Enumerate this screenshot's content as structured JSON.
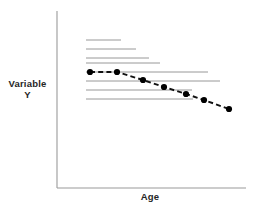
{
  "chart_data": {
    "type": "line",
    "title": "",
    "subtitle": "",
    "xlabel": "Age",
    "ylabel": "Variable\nY",
    "ylabel_line1": "Variable",
    "ylabel_line2": "Y",
    "grid": false,
    "legend": "none",
    "axis_ticks": "none",
    "xlim": [
      0,
      100
    ],
    "ylim": [
      0,
      100
    ],
    "series": [
      {
        "name": "Mean trajectory",
        "style": "dashed",
        "color": "#000000",
        "marker": "filled-circle",
        "marker_size": 4,
        "x": [
          15,
          31,
          47,
          60,
          73,
          84,
          99
        ],
        "y": [
          66,
          66,
          58,
          52,
          45,
          39,
          30
        ],
        "points": [
          {
            "x": 15,
            "y": 66
          },
          {
            "x": 31,
            "y": 66
          },
          {
            "x": 47,
            "y": 58
          },
          {
            "x": 60,
            "y": 52
          },
          {
            "x": 73,
            "y": 45
          },
          {
            "x": 84,
            "y": 39
          },
          {
            "x": 99,
            "y": 30
          }
        ]
      }
    ],
    "cohort_lines": [
      {
        "index": 1,
        "y": 83,
        "x_start": 15,
        "x_end": 34
      },
      {
        "index": 2,
        "y": 78,
        "x_start": 15,
        "x_end": 42
      },
      {
        "index": 3,
        "y": 73,
        "x_start": 15,
        "x_end": 45
      },
      {
        "index": 4,
        "y": 71,
        "x_start": 15,
        "x_end": 52
      },
      {
        "index": 5,
        "y": 66,
        "x_start": 15,
        "x_end": 81
      },
      {
        "index": 6,
        "y": 61,
        "x_start": 15,
        "x_end": 88
      },
      {
        "index": 7,
        "y": 56,
        "x_start": 15,
        "x_end": 73
      },
      {
        "index": 8,
        "y": 50,
        "x_start": 15,
        "x_end": 73
      }
    ]
  },
  "colors": {
    "axis": "#9a9a9a",
    "cohort_line": "#8c8c8c",
    "trend_line": "#111111",
    "marker_fill": "#000000",
    "label_text": "#262626",
    "background": "#ffffff"
  },
  "geometry": {
    "axis_x": 57,
    "axis_top": 11,
    "axis_bottom": 188,
    "axis_right": 246,
    "cohort_x_start": 86,
    "cohort_rows_y": [
      40,
      49,
      58,
      63,
      72,
      81,
      90,
      99
    ],
    "cohort_rows_x_end": [
      121,
      136,
      149,
      160,
      208,
      220,
      192,
      193
    ],
    "trend_points_px": [
      [
        90,
        72
      ],
      [
        117,
        72
      ],
      [
        143,
        80
      ],
      [
        164,
        87
      ],
      [
        186,
        94
      ],
      [
        204,
        100
      ],
      [
        229,
        109
      ]
    ]
  }
}
